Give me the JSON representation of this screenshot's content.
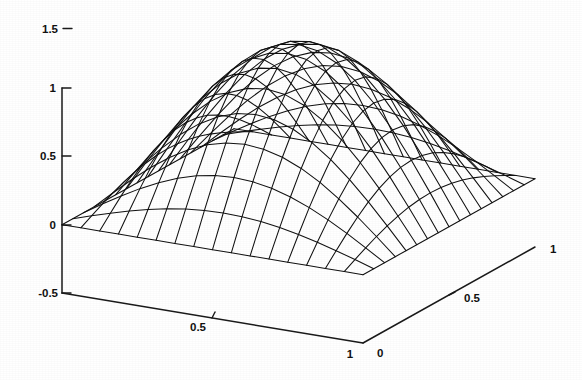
{
  "figure": {
    "background_color": "#ffffff",
    "line_color": "#111111",
    "detached_top_label": "1.5",
    "detached_top_tick": "–"
  },
  "chart_data": {
    "type": "surface",
    "title": "",
    "subtitle": "",
    "xlabel": "",
    "ylabel": "",
    "zlabel": "",
    "projection": "3d-mesh",
    "mesh_style": "wireframe",
    "grid": false,
    "legend": null,
    "legend_position": "none",
    "x": [
      0,
      0.0625,
      0.125,
      0.1875,
      0.25,
      0.3125,
      0.375,
      0.4375,
      0.5,
      0.5625,
      0.625,
      0.6875,
      0.75,
      0.8125,
      0.875,
      0.9375,
      1
    ],
    "y": [
      0,
      0.0625,
      0.125,
      0.1875,
      0.25,
      0.3125,
      0.375,
      0.4375,
      0.5,
      0.5625,
      0.625,
      0.6875,
      0.75,
      0.8125,
      0.875,
      0.9375,
      1
    ],
    "xlim": [
      0,
      1
    ],
    "ylim": [
      0,
      1
    ],
    "zlim": [
      -0.5,
      1.5
    ],
    "xticks": [
      0,
      0.5,
      1
    ],
    "yticks": [
      0,
      0.5,
      1
    ],
    "zticks": [
      -0.5,
      0,
      0.5,
      1,
      1.5
    ],
    "xticklabels": [
      "0",
      "0.5",
      "1"
    ],
    "yticklabels": [
      "0",
      "0.5",
      "1"
    ],
    "zticklabels": [
      "-0.5",
      "0",
      "0.5",
      "1",
      "1.5"
    ],
    "z_peak": 1.15,
    "z_peak_location": [
      0.5,
      0.5
    ],
    "z_min": 0.0,
    "surface_description": "Smooth single-peak dome, zero on all four boundary edges, maximum approximately 1.15 at the centre of the unit square",
    "surface_formula": "sin(pi*x)*sin(pi*y) scaled",
    "nrows": 17,
    "ncols": 17
  },
  "axes": {
    "z_axis": {
      "name": "z-axis",
      "ticks": [
        {
          "label": "1",
          "value": 1.0
        },
        {
          "label": "0.5",
          "value": 0.5
        },
        {
          "label": "0",
          "value": 0.0
        },
        {
          "label": "-0.5",
          "value": -0.5
        }
      ]
    },
    "x_axis_front_left": {
      "name": "x-axis",
      "ticks": [
        {
          "label": "0.5",
          "value": 0.5
        },
        {
          "label": "1",
          "value": 1.0
        }
      ]
    },
    "y_axis_front_right": {
      "name": "y-axis",
      "ticks": [
        {
          "label": "0",
          "value": 0.0
        },
        {
          "label": "0.5",
          "value": 0.5
        },
        {
          "label": "1",
          "value": 1.0
        }
      ]
    }
  }
}
